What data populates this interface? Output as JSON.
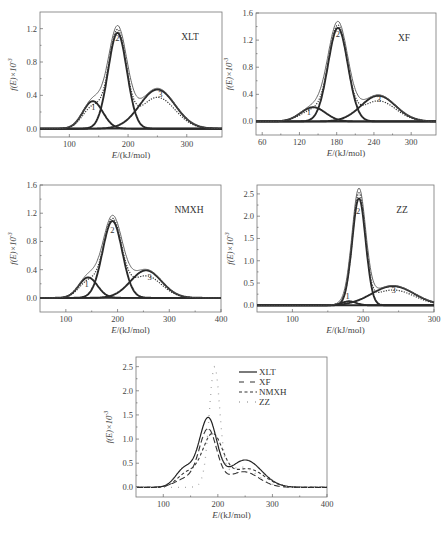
{
  "chart_data": [
    {
      "type": "line",
      "title": "XLT",
      "xlabel": "E/(kJ/mol)",
      "ylabel": "f(E)×10^-3",
      "xlim": [
        50,
        360
      ],
      "ylim": [
        -0.1,
        1.4
      ],
      "xticks": [
        100,
        200,
        300
      ],
      "yticks": [
        0.0,
        0.4,
        0.8,
        1.2
      ],
      "ytick_labels": [
        "0.0",
        "0.4",
        "0.8",
        "1.2"
      ],
      "grid": false,
      "components": [
        {
          "name": "1",
          "mu": 140,
          "sigma": 17,
          "amp": 0.33
        },
        {
          "name": "2",
          "mu": 182,
          "sigma": 16,
          "amp": 1.15
        },
        {
          "name": "3",
          "mu": 250,
          "sigma": 30,
          "amp": 0.47
        }
      ],
      "series": [
        {
          "name": "fitted sum",
          "style": "thin-solid"
        },
        {
          "name": "experimental",
          "style": "dotted"
        },
        {
          "name": "peak 1",
          "style": "thick-solid"
        },
        {
          "name": "peak 2",
          "style": "thick-solid"
        },
        {
          "name": "peak 3",
          "style": "thick-solid"
        }
      ],
      "peak_labels": [
        {
          "text": "1",
          "x": 141,
          "y": 0.22
        },
        {
          "text": "2",
          "x": 182,
          "y": 1.05
        },
        {
          "text": "3",
          "x": 255,
          "y": 0.38
        }
      ]
    },
    {
      "type": "line",
      "title": "XF",
      "xlabel": "E/(kJ/mol)",
      "ylabel": "f(E)×10^-3",
      "xlim": [
        50,
        340
      ],
      "ylim": [
        -0.2,
        1.6
      ],
      "xticks": [
        60,
        120,
        180,
        240,
        300
      ],
      "yticks": [
        0.0,
        0.4,
        0.8,
        1.2,
        1.6
      ],
      "ytick_labels": [
        "0.0",
        "0.4",
        "0.8",
        "1.2",
        "1.6"
      ],
      "grid": false,
      "components": [
        {
          "name": "1",
          "mu": 142,
          "sigma": 20,
          "amp": 0.21
        },
        {
          "name": "2",
          "mu": 182,
          "sigma": 16,
          "amp": 1.38
        },
        {
          "name": "3",
          "mu": 247,
          "sigma": 28,
          "amp": 0.38
        }
      ],
      "series": [
        {
          "name": "fitted sum",
          "style": "thin-solid"
        },
        {
          "name": "experimental",
          "style": "dotted"
        },
        {
          "name": "peak 1",
          "style": "thick-solid"
        },
        {
          "name": "peak 2",
          "style": "thick-solid"
        },
        {
          "name": "peak 3",
          "style": "thick-solid"
        }
      ],
      "peak_labels": [
        {
          "text": "1",
          "x": 135,
          "y": 0.1
        },
        {
          "text": "2",
          "x": 182,
          "y": 1.25
        },
        {
          "text": "3",
          "x": 248,
          "y": 0.28
        }
      ]
    },
    {
      "type": "line",
      "title": "NMXH",
      "xlabel": "E/(kJ/mol)",
      "ylabel": "f(E)×10^-3",
      "xlim": [
        50,
        400
      ],
      "ylim": [
        -0.2,
        1.6
      ],
      "xticks": [
        100,
        200,
        300,
        400
      ],
      "yticks": [
        0.0,
        0.4,
        0.8,
        1.2,
        1.6
      ],
      "ytick_labels": [
        "0.0",
        "0.4",
        "0.8",
        "1.2",
        "1.6"
      ],
      "grid": false,
      "components": [
        {
          "name": "1",
          "mu": 143,
          "sigma": 18,
          "amp": 0.29
        },
        {
          "name": "2",
          "mu": 190,
          "sigma": 19,
          "amp": 1.09
        },
        {
          "name": "3",
          "mu": 255,
          "sigma": 30,
          "amp": 0.39
        }
      ],
      "series": [
        {
          "name": "fitted sum",
          "style": "thin-solid"
        },
        {
          "name": "experimental",
          "style": "dotted"
        },
        {
          "name": "peak 1",
          "style": "thick-solid"
        },
        {
          "name": "peak 2",
          "style": "thick-solid"
        },
        {
          "name": "peak 3",
          "style": "thick-solid"
        }
      ],
      "peak_labels": [
        {
          "text": "1",
          "x": 140,
          "y": 0.15
        },
        {
          "text": "2",
          "x": 190,
          "y": 0.92
        },
        {
          "text": "3",
          "x": 262,
          "y": 0.25
        }
      ]
    },
    {
      "type": "line",
      "title": "ZZ",
      "xlabel": "E/(kJ/mol)",
      "ylabel": "f(E)×10^-3",
      "xlim": [
        50,
        300
      ],
      "ylim": [
        -0.15,
        2.7
      ],
      "xticks": [
        100,
        200,
        300
      ],
      "yticks": [
        0.0,
        0.5,
        1.0,
        1.5,
        2.0,
        2.5
      ],
      "ytick_labels": [
        "0.0",
        "0.5",
        "1.0",
        "1.5",
        "2.0",
        "2.5"
      ],
      "grid": false,
      "components": [
        {
          "name": "1",
          "mu": 180,
          "sigma": 10,
          "amp": 0.09
        },
        {
          "name": "2",
          "mu": 194,
          "sigma": 9.5,
          "amp": 2.4
        },
        {
          "name": "3",
          "mu": 242,
          "sigma": 30,
          "amp": 0.43
        }
      ],
      "series": [
        {
          "name": "fitted sum",
          "style": "thin-solid"
        },
        {
          "name": "experimental",
          "style": "dotted"
        },
        {
          "name": "peak 1",
          "style": "thick-solid"
        },
        {
          "name": "peak 2",
          "style": "thick-solid"
        },
        {
          "name": "peak 3",
          "style": "thick-solid"
        }
      ],
      "peak_labels": [
        {
          "text": "1",
          "x": 178,
          "y": 0.15
        },
        {
          "text": "2",
          "x": 193,
          "y": 2.05
        },
        {
          "text": "3",
          "x": 243,
          "y": 0.28
        }
      ]
    },
    {
      "type": "line",
      "title": "",
      "xlabel": "E/(kJ/mol)",
      "ylabel": "f(E)×10^-3",
      "xlim": [
        50,
        400
      ],
      "ylim": [
        -0.2,
        2.7
      ],
      "xticks": [
        100,
        200,
        300,
        400
      ],
      "yticks": [
        0.0,
        0.5,
        1.0,
        1.5,
        2.0,
        2.5
      ],
      "ytick_labels": [
        "0.0",
        "0.5",
        "1.0",
        "1.5",
        "2.0",
        "2.5"
      ],
      "grid": false,
      "legend": {
        "position": "upper right",
        "entries": [
          "XLT",
          "XF",
          "NMXH",
          "ZZ"
        ]
      },
      "series": [
        {
          "name": "XLT",
          "style": "solid",
          "source_panel": 0,
          "peak_value": 1.45,
          "peak_x": 183
        },
        {
          "name": "XF",
          "style": "long-dash",
          "source_panel": 1,
          "peak_value": 1.22,
          "peak_x": 182
        },
        {
          "name": "NMXH",
          "style": "short-dash",
          "source_panel": 2,
          "peak_value": 1.12,
          "peak_x": 190
        },
        {
          "name": "ZZ",
          "style": "sparse-dot",
          "source_panel": 3,
          "peak_value": 2.5,
          "peak_x": 194
        }
      ]
    }
  ],
  "figure": {
    "legend": [
      "XLT",
      "XF",
      "NMXH",
      "ZZ"
    ],
    "x_axis_title": "E/(kJ/mol)",
    "y_axis_title": "f(E)×10",
    "y_axis_exponent": "-3"
  }
}
